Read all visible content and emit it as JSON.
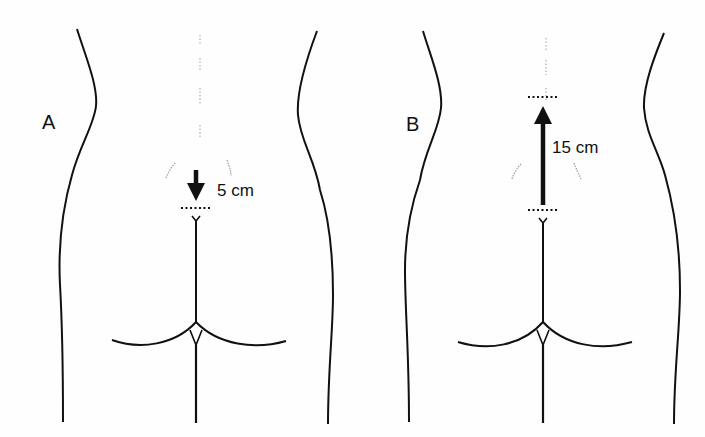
{
  "panels": [
    {
      "id": "A",
      "label": "A",
      "measurement": "5 cm",
      "arrow_direction": "down"
    },
    {
      "id": "B",
      "label": "B",
      "measurement": "15 cm",
      "arrow_direction": "up"
    }
  ],
  "colors": {
    "line": "#111111",
    "faint": "#9a9a9a",
    "background": "#fefefe"
  }
}
